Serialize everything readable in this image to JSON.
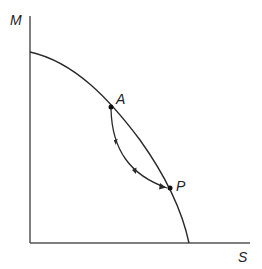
{
  "diagram": {
    "axes": {
      "y_label": "M",
      "x_label": "S"
    },
    "points": [
      {
        "label": "A"
      },
      {
        "label": "P"
      }
    ],
    "colors": {
      "line": "#2a2a2a",
      "axis": "#555555"
    }
  }
}
